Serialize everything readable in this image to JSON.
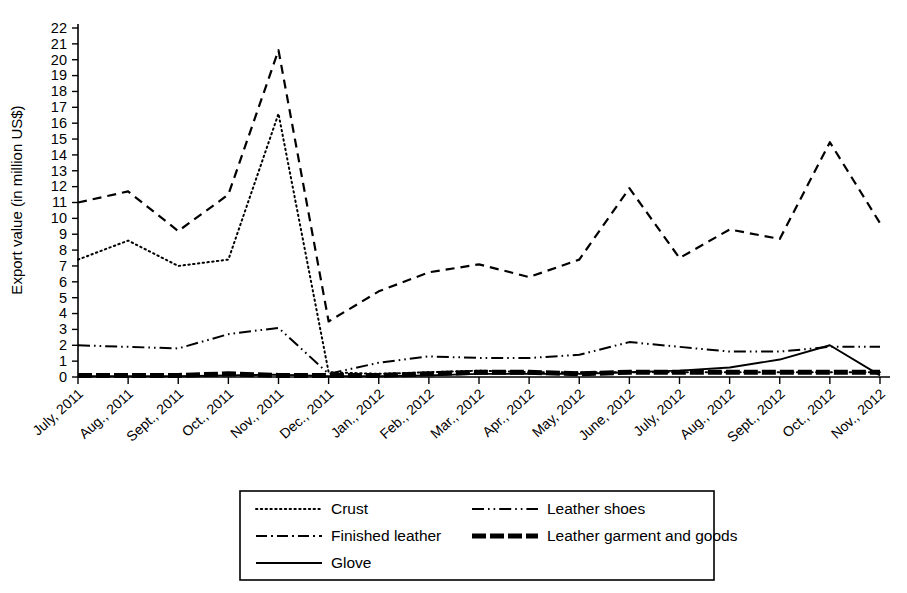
{
  "chart_data": {
    "type": "line",
    "title": "",
    "xlabel": "",
    "ylabel": "Export value (in million US$)",
    "ylim": [
      0,
      22
    ],
    "ytick_step": 1,
    "grid": false,
    "legend_position": "bottom",
    "categories": [
      "July, 2011",
      "Aug., 2011",
      "Sept., 2011",
      "Oct., 2011",
      "Nov., 2011",
      "Dec., 2011",
      "Jan., 2012",
      "Feb., 2012",
      "Mar., 2012",
      "Apr., 2012",
      "May, 2012",
      "June, 2012",
      "July, 2012",
      "Aug., 2012",
      "Sept., 2012",
      "Oct., 2012",
      "Nov., 2012"
    ],
    "yticks": [
      "0",
      "1",
      "2",
      "3",
      "4",
      "5",
      "6",
      "7",
      "8",
      "9",
      "10",
      "11",
      "12",
      "13",
      "14",
      "15",
      "16",
      "17",
      "18",
      "19",
      "20",
      "21",
      "22"
    ],
    "series": [
      {
        "name": "Crust",
        "style": "dotted",
        "values": [
          7.4,
          8.6,
          7.0,
          7.4,
          16.6,
          0.3,
          0.2,
          0.3,
          0.4,
          0.3,
          0.3,
          0.3,
          0.3,
          0.3,
          0.3,
          0.3,
          0.3
        ]
      },
      {
        "name": "Finished leather",
        "style": "dashed",
        "values": [
          11.0,
          11.7,
          9.2,
          11.5,
          20.6,
          3.5,
          5.4,
          6.6,
          7.1,
          6.3,
          7.4,
          11.9,
          7.5,
          9.3,
          8.7,
          14.8,
          9.7
        ]
      },
      {
        "name": "Leather shoes",
        "style": "dash-dot-dot",
        "values": [
          2.0,
          1.9,
          1.8,
          2.7,
          3.1,
          0.2,
          0.9,
          1.3,
          1.2,
          1.2,
          1.4,
          2.2,
          1.9,
          1.6,
          1.6,
          1.9,
          1.9
        ]
      },
      {
        "name": "Leather garment and goods",
        "style": "thick-dashed",
        "values": [
          0.1,
          0.1,
          0.1,
          0.2,
          0.1,
          0.1,
          0.1,
          0.2,
          0.3,
          0.3,
          0.2,
          0.3,
          0.3,
          0.3,
          0.3,
          0.3,
          0.3
        ]
      },
      {
        "name": "Glove",
        "style": "solid",
        "values": [
          0.05,
          0.05,
          0.05,
          0.1,
          0.15,
          0.05,
          0.05,
          0.1,
          0.2,
          0.2,
          0.2,
          0.3,
          0.4,
          0.6,
          1.1,
          2.0,
          0.1
        ]
      }
    ]
  },
  "legend": {
    "entries": [
      {
        "label": "Crust",
        "style": "dotted"
      },
      {
        "label": "Leather shoes",
        "style": "dash-dot-dot"
      },
      {
        "label": "Finished leather",
        "style": "dash-dot"
      },
      {
        "label": "Leather garment and goods",
        "style": "thick-dashed"
      },
      {
        "label": "Glove",
        "style": "solid"
      }
    ]
  },
  "axis": {
    "y_title": "Export value (in million US$)"
  },
  "colors": {
    "foreground": "#000000",
    "background": "#ffffff"
  }
}
